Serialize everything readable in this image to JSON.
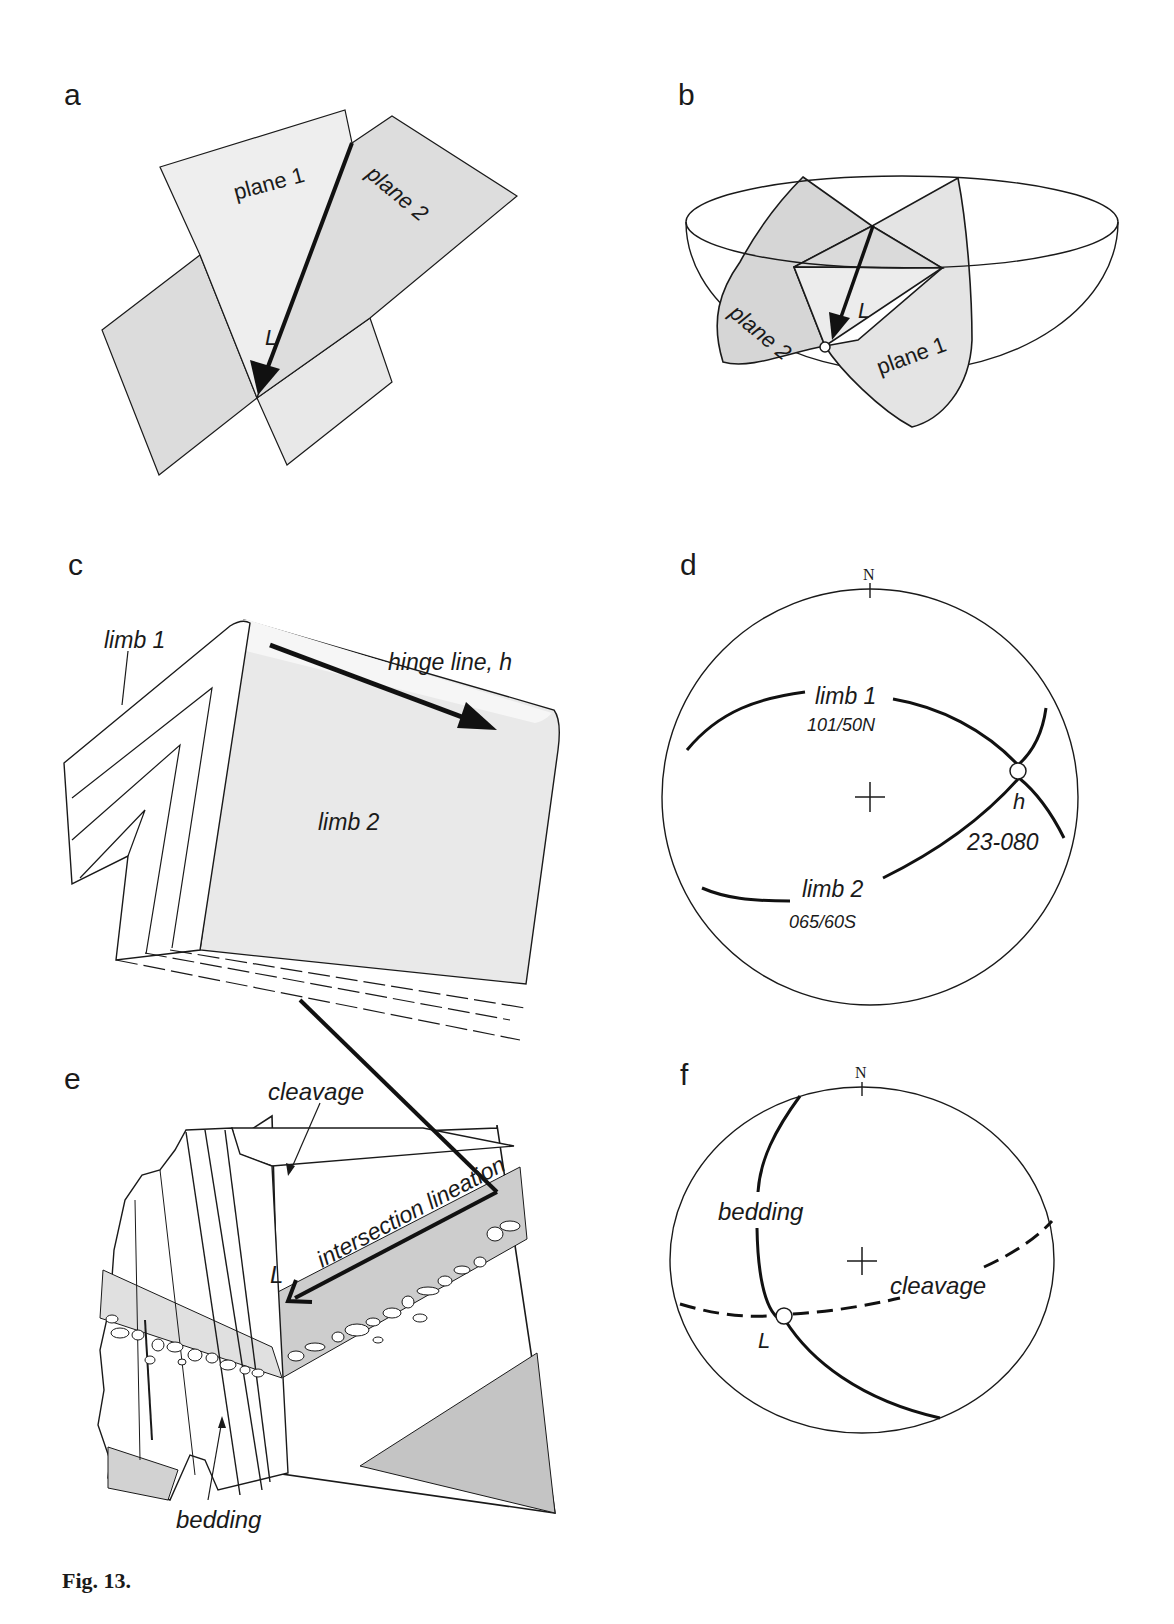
{
  "figure": {
    "caption": "Fig. 13.",
    "colors": {
      "ink": "#1a1a1a",
      "light_gray": "#e6e6e6",
      "mid_gray": "#cfcfcf",
      "dark_gray": "#bcbcbc",
      "background": "#ffffff"
    }
  },
  "panels": {
    "a": {
      "label": "a",
      "plane1": "plane 1",
      "plane2": "plane 2",
      "lineation": "L"
    },
    "b": {
      "label": "b",
      "plane1": "plane 1",
      "plane2": "plane 2",
      "lineation": "L"
    },
    "c": {
      "label": "c",
      "limb1": "limb 1",
      "limb2": "limb 2",
      "hinge": "hinge line, h"
    },
    "d": {
      "label": "d",
      "north": "N",
      "limb1": "limb 1",
      "limb1_orientation": "101/50N",
      "limb2": "limb 2",
      "limb2_orientation": "065/60S",
      "hinge": "h",
      "hinge_orientation": "23-080"
    },
    "e": {
      "label": "e",
      "cleavage": "cleavage",
      "intersection": "intersection lineation",
      "lineation": "L",
      "bedding": "bedding"
    },
    "f": {
      "label": "f",
      "north": "N",
      "bedding": "bedding",
      "cleavage": "cleavage",
      "lineation": "L"
    }
  }
}
